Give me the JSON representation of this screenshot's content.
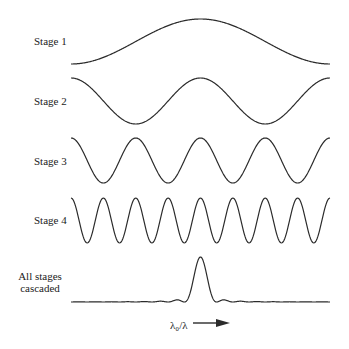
{
  "figure": {
    "rows": [
      {
        "label": "Stage 1",
        "periods_across": 1,
        "phase": "peak-centered"
      },
      {
        "label": "Stage 2",
        "periods_across": 2,
        "phase": "peak-centered"
      },
      {
        "label": "Stage 3",
        "periods_across": 4,
        "phase": "peak-centered"
      },
      {
        "label": "Stage 4",
        "periods_across": 8,
        "phase": "peak-centered"
      },
      {
        "label_line1": "All stages",
        "label_line2": "cascaded",
        "description": "single narrow transmission peak at center with small side ripples"
      }
    ],
    "x_axis": {
      "label": "λ₀/λ",
      "arrow": "right-arrow"
    },
    "colors": {
      "line": "#2b2b2b",
      "background": "#ffffff"
    }
  }
}
